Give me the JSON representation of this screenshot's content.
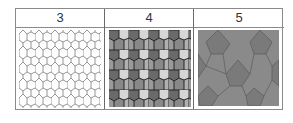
{
  "table": {
    "columns": [
      {
        "header": "3",
        "pattern": "pentagon-outline",
        "fill": "#ffffff",
        "stroke": "#7a7a7a"
      },
      {
        "header": "4",
        "pattern": "pentagon-shaded",
        "fill_colors": [
          "#6e6e6e",
          "#8c8c8c",
          "#a8a8a8",
          "#d8d8d8"
        ],
        "stroke": "#1a1a1a"
      },
      {
        "header": "5",
        "pattern": "hexagon-pentagon-gray",
        "fill_colors": [
          "#8a8a8a",
          "#7a7a7a",
          "#949494"
        ],
        "stroke": "#5a5a5a"
      }
    ]
  }
}
